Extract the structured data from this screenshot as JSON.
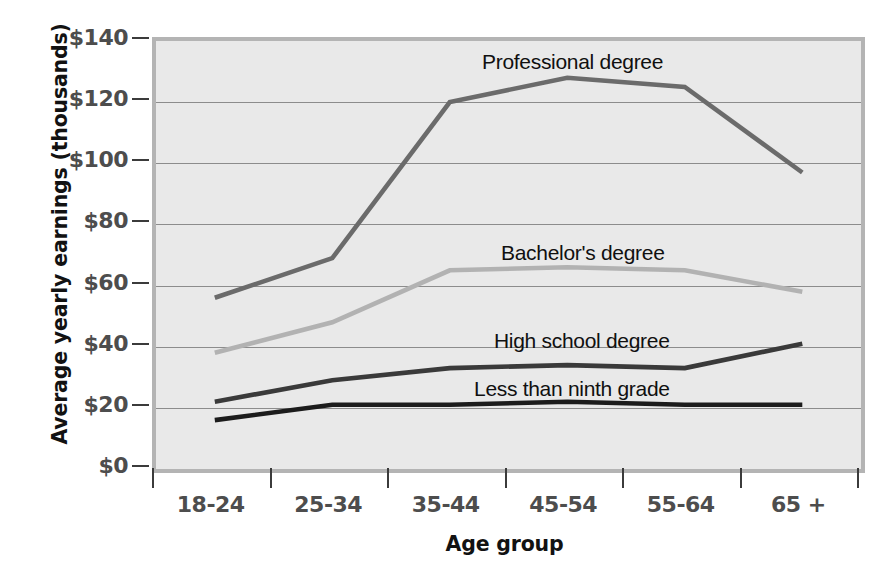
{
  "chart_data": {
    "type": "line",
    "title": "",
    "xlabel": "Age group",
    "ylabel": "Average yearly earnings (thousands)",
    "categories": [
      "18-24",
      "25-34",
      "35-44",
      "45-54",
      "55-64",
      "65 +"
    ],
    "ylim": [
      0,
      140
    ],
    "yticks": [
      "$0",
      "$20",
      "$40",
      "$60",
      "$80",
      "$100",
      "$120",
      "$140"
    ],
    "ytick_values": [
      0,
      20,
      40,
      60,
      80,
      100,
      120,
      140
    ],
    "grid": true,
    "legend_position": "inline-labels",
    "series": [
      {
        "name": "Professional degree",
        "color": "#6b6b6b",
        "values": [
          56,
          69,
          120,
          128,
          125,
          97
        ]
      },
      {
        "name": "Bachelor's degree",
        "color": "#b2b2b2",
        "values": [
          38,
          48,
          65,
          66,
          65,
          58
        ]
      },
      {
        "name": "High school degree",
        "color": "#3a3a3a",
        "values": [
          22,
          29,
          33,
          34,
          33,
          41
        ]
      },
      {
        "name": "Less than ninth grade",
        "color": "#1c1c1c",
        "values": [
          16,
          21,
          21,
          22,
          21,
          21
        ]
      }
    ],
    "annotations": [
      {
        "text": "Professional degree",
        "x_px": 478,
        "y_px": 46
      },
      {
        "text": "Bachelor's degree",
        "x_px": 497,
        "y_px": 237
      },
      {
        "text": "High school degree",
        "x_px": 490,
        "y_px": 325
      },
      {
        "text": "Less than ninth grade",
        "x_px": 470,
        "y_px": 373
      }
    ],
    "plot_bg_color": "#e9e9e9",
    "plot_border_color": "#b4b4b4"
  }
}
